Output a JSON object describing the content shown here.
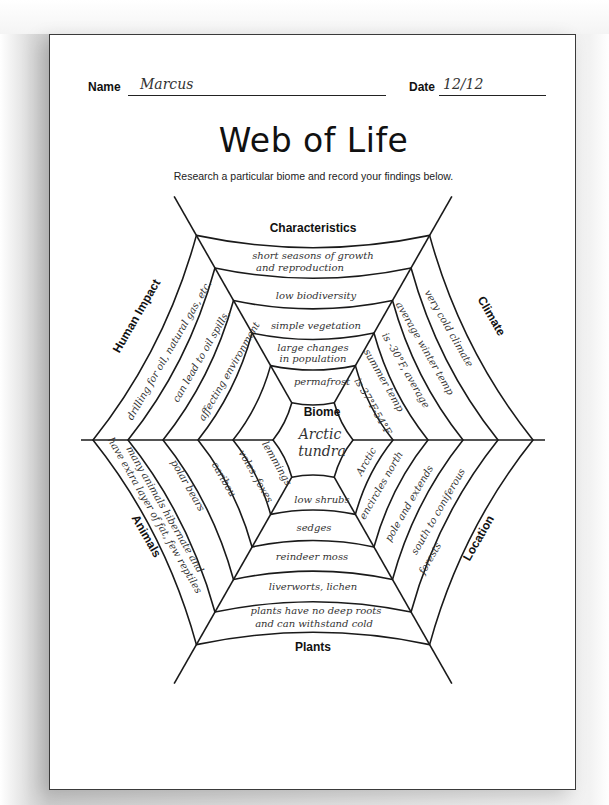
{
  "worksheet": {
    "name_label": "Name",
    "name_value": "Marcus",
    "date_label": "Date",
    "date_value": "12/12",
    "title": "Web of Life",
    "subtitle": "Research a particular biome and record your findings below."
  },
  "web": {
    "center": {
      "label": "Biome",
      "value_line1": "Arctic",
      "value_line2": "tundra"
    },
    "categories": {
      "top": "Characteristics",
      "upper_right": "Climate",
      "lower_right": "Location",
      "bottom": "Plants",
      "lower_left": "Animals",
      "upper_left": "Human Impact"
    },
    "characteristics": [
      "permafrost",
      "large changes in population",
      "simple vegetation",
      "low biodiversity",
      "short seasons of growth and reproduction"
    ],
    "characteristics_lines": {
      "c1a": "large changes",
      "c1b": "in population",
      "c4a": "short seasons of growth",
      "c4b": "and reproduction"
    },
    "climate": [
      "is 37°F-54°F",
      "summer temp",
      "is -30°F, average",
      "average winter temp",
      "very cold climate"
    ],
    "location": [
      "Arctic",
      "encircles north",
      "pole and extends",
      "south to coniferous",
      "forests"
    ],
    "plants": [
      "low shrubs",
      "sedges",
      "reindeer moss",
      "liverworts, lichen",
      "plants have no deep roots and can withstand cold"
    ],
    "plants_lines": {
      "p4a": "plants have no deep roots",
      "p4b": "and can withstand cold"
    },
    "animals": [
      "lemmings",
      "voles, foxes",
      "caribou",
      "polar bears",
      "many animals hibernate and have extra layer of fat, few reptiles"
    ],
    "animals_lines": {
      "a4a": "many animals hibernate and",
      "a4b": "have extra layer of fat, few reptiles"
    },
    "human_impact": [
      "",
      "",
      "affecting environment",
      "can lead to oil spills,",
      "drilling for oil, natural gas, etc."
    ]
  },
  "colors": {
    "ink": "#111111",
    "pencil": "#333333",
    "paper": "#ffffff"
  }
}
